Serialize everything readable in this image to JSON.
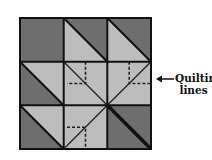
{
  "diagram": {
    "type": "quilt-block",
    "grid": {
      "rows": 3,
      "cols": 3
    },
    "colors": {
      "dark": "#6e6e6e",
      "light": "#bdbdbd",
      "line": "#111111"
    },
    "cells": [
      [
        "solid-dark",
        "diag-tl-br-dark-upper-right",
        "diag-tl-br-dark-upper-right"
      ],
      [
        "diag-tl-br-dark-lower-left",
        "light-quilted-tl-br",
        "light-quilted-bl-tr"
      ],
      [
        "diag-tl-br-dark-lower-left",
        "light-quilted-tr-bl",
        "solid-dark-double-diagonal"
      ]
    ]
  },
  "annotation": {
    "line1": "Quilting",
    "line2": "lines",
    "arrow": "left-arrow-icon"
  }
}
